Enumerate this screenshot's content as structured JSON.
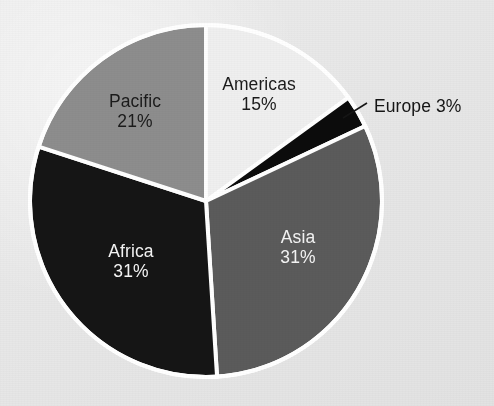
{
  "figure": {
    "background_color": "#e9e9e9",
    "pie": {
      "center_x": 206,
      "center_y": 201,
      "radius": 176,
      "separator_color": "#ffffff",
      "separator_width": 4,
      "start_angle_deg": 0,
      "direction": "clockwise"
    }
  },
  "chart_data": {
    "type": "pie",
    "title": "",
    "subtitle": "",
    "xlabel": "",
    "ylabel": "",
    "legend_position": "none",
    "grid": false,
    "labels_show_percent": true,
    "categories": [
      "Americas",
      "Europe",
      "Asia",
      "Africa",
      "Pacific"
    ],
    "values": [
      15,
      3,
      31,
      31,
      21
    ],
    "slices": [
      {
        "name": "Americas",
        "value": 15,
        "percent_text": "15%",
        "label_text": "Americas",
        "color": "#efefef",
        "text_color": "#1b1b1b",
        "label_placement": "inside",
        "start_angle_deg": 0,
        "end_angle_deg": 54,
        "label_x": 259,
        "label_y": 95
      },
      {
        "name": "Europe",
        "value": 3,
        "percent_text": "3%",
        "label_text": "Europe 3%",
        "color": "#0c0c0c",
        "text_color": "#151515",
        "label_placement": "outside-callout",
        "start_angle_deg": 54,
        "end_angle_deg": 64.8,
        "label_x": 374,
        "label_y": 96,
        "leader_from_x": 343,
        "leader_from_y": 118,
        "leader_to_x": 367,
        "leader_to_y": 103
      },
      {
        "name": "Asia",
        "value": 31,
        "percent_text": "31%",
        "label_text": "Asia",
        "color": "#5b5b5b",
        "text_color": "#f4f4f4",
        "label_placement": "inside",
        "start_angle_deg": 64.8,
        "end_angle_deg": 176.4,
        "label_x": 298,
        "label_y": 248
      },
      {
        "name": "Africa",
        "value": 31,
        "percent_text": "31%",
        "label_text": "Africa",
        "color": "#151515",
        "text_color": "#f4f4f4",
        "label_placement": "inside",
        "start_angle_deg": 176.4,
        "end_angle_deg": 288,
        "label_x": 131,
        "label_y": 262
      },
      {
        "name": "Pacific",
        "value": 21,
        "percent_text": "21%",
        "label_text": "Pacific",
        "color": "#8d8d8d",
        "text_color": "#1b1b1b",
        "label_placement": "inside",
        "start_angle_deg": 288,
        "end_angle_deg": 360,
        "label_x": 135,
        "label_y": 112
      }
    ]
  }
}
